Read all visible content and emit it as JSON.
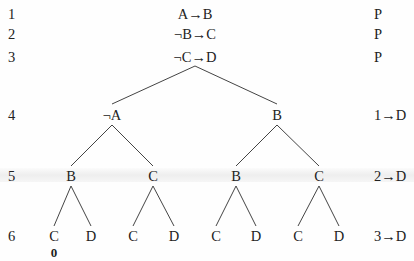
{
  "rows": [
    {
      "n": "1",
      "formula": "A→B",
      "justification": "P"
    },
    {
      "n": "2",
      "formula": "¬B→C",
      "justification": "P"
    },
    {
      "n": "3",
      "formula": "¬C→D",
      "justification": "P"
    },
    {
      "n": "4",
      "nodes": [
        "¬A",
        "B"
      ],
      "justification": "1→D"
    },
    {
      "n": "5",
      "nodes": [
        "B",
        "C",
        "B",
        "C"
      ],
      "justification": "2→D"
    },
    {
      "n": "6",
      "nodes": [
        "C",
        "D",
        "C",
        "D",
        "C",
        "D",
        "C",
        "D"
      ],
      "justification": "3→D"
    }
  ],
  "closure_marks": [
    {
      "under_row": "6",
      "node_index": 0,
      "label": "0"
    }
  ]
}
